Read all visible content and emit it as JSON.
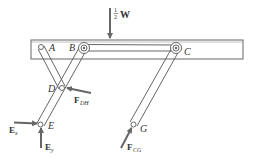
{
  "diagram": {
    "type": "free-body diagram of linkage",
    "labels": {
      "A": "A",
      "B": "B",
      "C": "C",
      "D": "D",
      "E": "E",
      "G": "G"
    },
    "forces": {
      "half_w_frac_num": "1",
      "half_w_frac_den": "2",
      "half_w_symbol": "W",
      "f_dh_main": "F",
      "f_dh_sub": "DH",
      "e_x_main": "E",
      "e_x_sub": "x",
      "e_y_main": "E",
      "e_y_sub": "y",
      "f_cg_main": "F",
      "f_cg_sub": "CG"
    },
    "colors": {
      "line": "#555555",
      "arrow": "#666666",
      "background": "#ffffff"
    }
  }
}
